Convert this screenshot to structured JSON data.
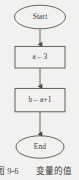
{
  "figure": {
    "caption_number": "图 9-6",
    "caption_text": "变量的值",
    "stroke_color": "#55534f",
    "text_color": "#3b3a38",
    "background_color": "#f2f1ef"
  },
  "flowchart": {
    "type": "flowchart",
    "orientation": "top-to-bottom",
    "nodes": [
      {
        "id": "start",
        "shape": "ellipse",
        "label": "Start"
      },
      {
        "id": "assign_a",
        "shape": "rectangle",
        "label": "a←3"
      },
      {
        "id": "assign_b",
        "shape": "rectangle",
        "label": "b←a+1"
      },
      {
        "id": "end",
        "shape": "ellipse",
        "label": "End"
      }
    ],
    "edges": [
      {
        "from": "start",
        "to": "assign_a",
        "arrow": "down"
      },
      {
        "from": "assign_a",
        "to": "assign_b",
        "arrow": "down"
      },
      {
        "from": "assign_b",
        "to": "end",
        "arrow": "down"
      }
    ]
  }
}
